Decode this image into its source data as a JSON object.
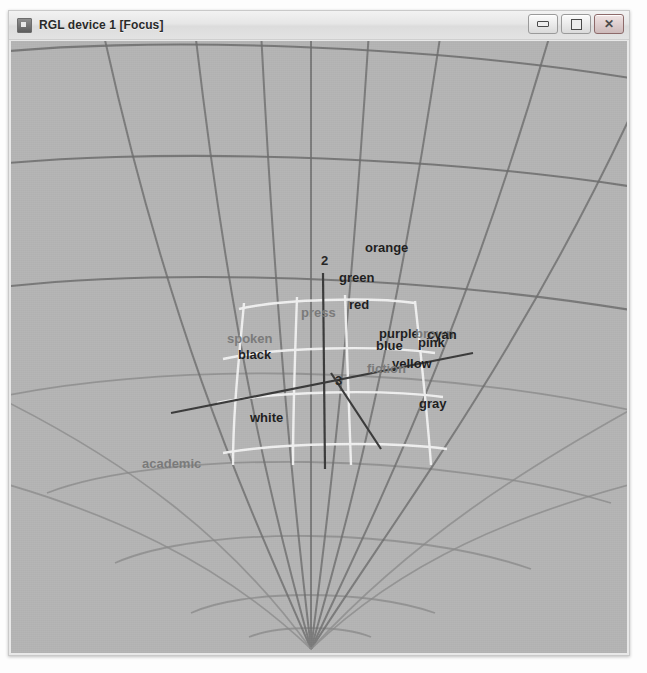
{
  "window": {
    "title": "RGL device 1 [Focus]",
    "icon": "rgl-app-icon",
    "buttons": {
      "minimize": "minimize-button",
      "maximize": "maximize-button",
      "close_glyph": "✕"
    }
  },
  "scene": {
    "background_color": "#b5b5b5",
    "sphere_line_color": "#6f6f6f",
    "inner_mesh_color": "#f2f2f2",
    "axis_color": "#3a3a3a",
    "description": "3D rgl sphere wireframe with word labels projected onto the surface"
  },
  "axis_ticks": [
    {
      "label": "2",
      "x": 312,
      "y": 243
    },
    {
      "label": "3",
      "x": 326,
      "y": 363
    }
  ],
  "labels": [
    {
      "text": "orange",
      "x": 356,
      "y": 230,
      "tone": "dark"
    },
    {
      "text": "green",
      "x": 330,
      "y": 260,
      "tone": "dark"
    },
    {
      "text": "red",
      "x": 340,
      "y": 287,
      "tone": "dark"
    },
    {
      "text": "press",
      "x": 292,
      "y": 295,
      "tone": "mid"
    },
    {
      "text": "spoken",
      "x": 218,
      "y": 321,
      "tone": "mid"
    },
    {
      "text": "black",
      "x": 229,
      "y": 337,
      "tone": "dark"
    },
    {
      "text": "purple",
      "x": 370,
      "y": 316,
      "tone": "dark"
    },
    {
      "text": "brown",
      "x": 406,
      "y": 316,
      "tone": "mid"
    },
    {
      "text": "cyan",
      "x": 418,
      "y": 317,
      "tone": "dark"
    },
    {
      "text": "blue",
      "x": 367,
      "y": 328,
      "tone": "dark"
    },
    {
      "text": "pink",
      "x": 409,
      "y": 325,
      "tone": "dark"
    },
    {
      "text": "yellow",
      "x": 383,
      "y": 346,
      "tone": "dark"
    },
    {
      "text": "fiction",
      "x": 358,
      "y": 351,
      "tone": "mid"
    },
    {
      "text": "gray",
      "x": 410,
      "y": 386,
      "tone": "dark"
    },
    {
      "text": "white",
      "x": 241,
      "y": 400,
      "tone": "dark"
    },
    {
      "text": "academic",
      "x": 133,
      "y": 446,
      "tone": "mid"
    }
  ]
}
